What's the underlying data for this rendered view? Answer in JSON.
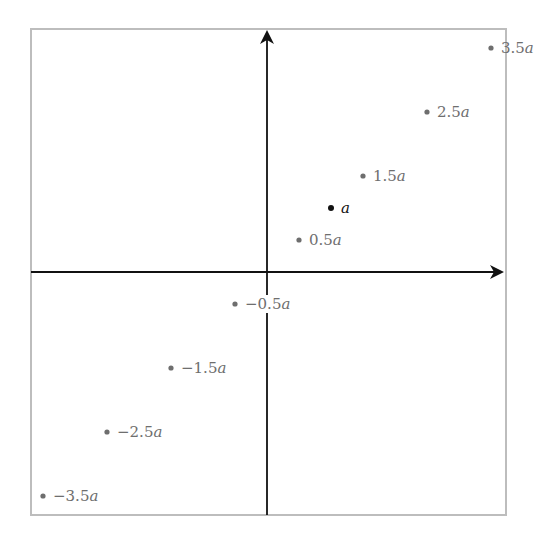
{
  "diagram": {
    "frame": {
      "x": 31,
      "y": 29,
      "width": 475,
      "height": 486,
      "stroke": "#bdbdbd"
    },
    "origin": {
      "x": 267,
      "y": 272
    },
    "unit_px": 64,
    "axes": {
      "x_axis": {
        "from": 31,
        "to": 504,
        "color": "#111111"
      },
      "y_axis": {
        "from": 515,
        "to": 30,
        "color": "#111111"
      }
    },
    "colors": {
      "point_grey": "#6e6e6e",
      "point_highlight": "#111111"
    },
    "points": [
      {
        "value": 3.5,
        "label": "3.5a",
        "num": "3.5",
        "highlight": false
      },
      {
        "value": 2.5,
        "label": "2.5a",
        "num": "2.5",
        "highlight": false
      },
      {
        "value": 1.5,
        "label": "1.5a",
        "num": "1.5",
        "highlight": false
      },
      {
        "value": 1.0,
        "label": "a",
        "num": "",
        "highlight": true
      },
      {
        "value": 0.5,
        "label": "0.5a",
        "num": "0.5",
        "highlight": false
      },
      {
        "value": -0.5,
        "label": "−0.5a",
        "num": "−0.5",
        "highlight": false
      },
      {
        "value": -1.5,
        "label": "−1.5a",
        "num": "−1.5",
        "highlight": false
      },
      {
        "value": -2.5,
        "label": "−2.5a",
        "num": "−2.5",
        "highlight": false
      },
      {
        "value": -3.5,
        "label": "−3.5a",
        "num": "−3.5",
        "highlight": false
      }
    ]
  }
}
